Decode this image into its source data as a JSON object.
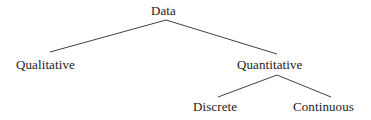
{
  "diagram": {
    "type": "tree",
    "background_color": "#ffffff",
    "line_color": "#2a2a2a",
    "text_color": "#1b1b1b",
    "nodes": [
      {
        "id": "data",
        "label": "Data",
        "level": 0
      },
      {
        "id": "qualitative",
        "label": "Qualitative",
        "level": 1
      },
      {
        "id": "quantitative",
        "label": "Quantitative",
        "level": 1
      },
      {
        "id": "discrete",
        "label": "Discrete",
        "level": 2
      },
      {
        "id": "continuous",
        "label": "Continuous",
        "level": 2
      }
    ],
    "edges": [
      {
        "from": "data",
        "to": "qualitative"
      },
      {
        "from": "data",
        "to": "quantitative"
      },
      {
        "from": "quantitative",
        "to": "discrete"
      },
      {
        "from": "quantitative",
        "to": "continuous"
      }
    ]
  }
}
